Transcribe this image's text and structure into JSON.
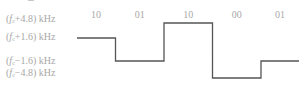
{
  "diagram": {
    "type": "4-FSK frequency waveform",
    "frequency_levels": [
      {
        "id": "p48",
        "prefix": "(",
        "var": "f",
        "sub": "c",
        "suffix": "+4.8) kHz",
        "offset_khz": 4.8
      },
      {
        "id": "p16",
        "prefix": "(",
        "var": "f",
        "sub": "c",
        "suffix": "+1.6) kHz",
        "offset_khz": 1.6
      },
      {
        "id": "m16",
        "prefix": "(",
        "var": "f",
        "sub": "c",
        "suffix": "−1.6) kHz",
        "offset_khz": -1.6
      },
      {
        "id": "m48",
        "prefix": "(",
        "var": "f",
        "sub": "c",
        "suffix": "−4.8) kHz",
        "offset_khz": -4.8
      }
    ],
    "symbols": [
      {
        "bits": "10",
        "offset_khz": 1.6
      },
      {
        "bits": "01",
        "offset_khz": -1.6
      },
      {
        "bits": "10",
        "offset_khz": 4.8
      },
      {
        "bits": "00",
        "offset_khz": -4.8
      },
      {
        "bits": "01",
        "offset_khz": -1.6
      }
    ],
    "line_color": "#555555",
    "label_color": "#a8a8a8"
  }
}
